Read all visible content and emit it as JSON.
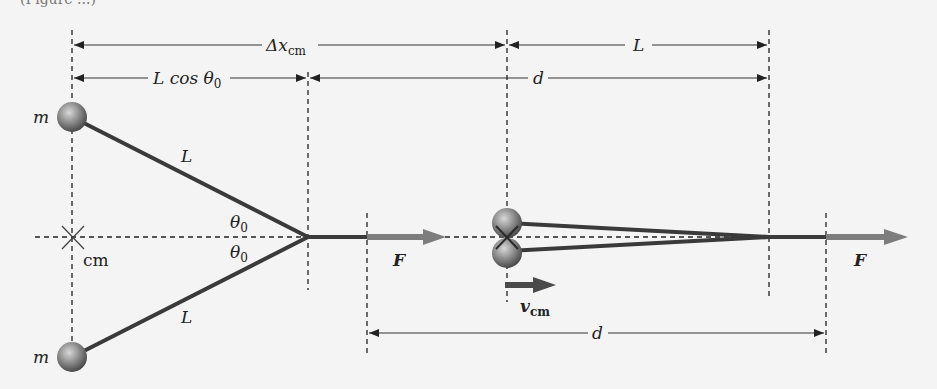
{
  "figure": {
    "partial_caption": "(Figure ...)",
    "colors": {
      "background": "#f4f4f4",
      "rod": "#3a3a3a",
      "force_arrow": "#7d7d7d",
      "velocity_arrow": "#4a4a4a",
      "mass_sphere": "#808080",
      "line": "#222222"
    },
    "dimensions": {
      "delta_x_cm": {
        "main": "Δx",
        "sub": "cm"
      },
      "l_cos_theta": {
        "main": "L cos θ",
        "sub": "0"
      },
      "top_right_L": "L",
      "top_d": "d",
      "bottom_d": "d"
    },
    "left_config": {
      "mass_top_label": "m",
      "mass_bottom_label": "m",
      "rod_top_label": "L",
      "rod_bottom_label": "L",
      "angle_top": {
        "main": "θ",
        "sub": "0"
      },
      "angle_bottom": {
        "main": "θ",
        "sub": "0"
      },
      "cm_label": "cm",
      "force_label": "F"
    },
    "right_config": {
      "velocity_label": {
        "main": "v",
        "sub": "cm"
      },
      "force_label": "F"
    }
  }
}
